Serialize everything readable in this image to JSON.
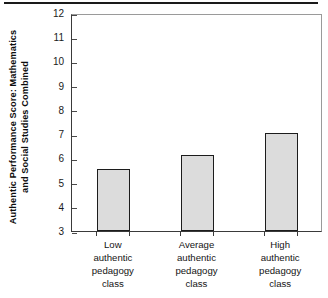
{
  "figure": {
    "top_rule": "horizontal-rule",
    "background_color": "#ffffff",
    "bar_fill_color": "#dcdcdc",
    "bar_border_color": "#1c1c1c",
    "axis_color": "#3a3a3a"
  },
  "chart_data": {
    "type": "bar",
    "title": "",
    "xlabel": "",
    "ylabel": "Authentic Performance Score: Mathematics and Social Studies Combined",
    "ylabel_lines": [
      "Authentic Performance Score: Mathematics",
      "and Social Studies Combined"
    ],
    "categories": [
      "Low authentic pedagogy class",
      "Average authentic pedagogy class",
      "High authentic pedagogy class"
    ],
    "category_lines": [
      [
        "Low",
        "authentic",
        "pedagogy",
        "class"
      ],
      [
        "Average",
        "authentic",
        "pedagogy",
        "class"
      ],
      [
        "High",
        "authentic",
        "pedagogy",
        "class"
      ]
    ],
    "values": [
      5.55,
      6.15,
      7.05
    ],
    "ylim": [
      3,
      12
    ],
    "yticks": [
      3,
      4,
      5,
      6,
      7,
      8,
      9,
      10,
      11,
      12
    ],
    "ytick_labels": [
      "3",
      "4",
      "5",
      "6",
      "7",
      "8",
      "9",
      "10",
      "11",
      "12"
    ],
    "grid": false,
    "legend": null
  }
}
